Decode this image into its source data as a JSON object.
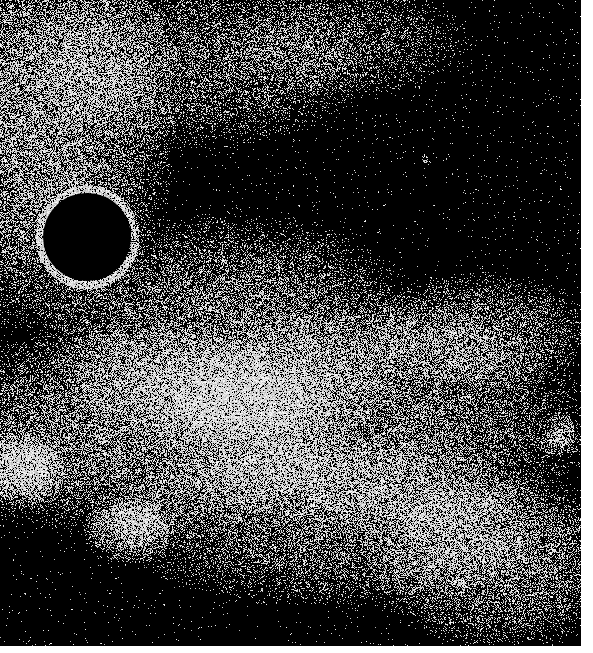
{
  "image": {
    "subject": "starfield-illustration",
    "scene_width": 581,
    "scene_height": 646,
    "background_color": "#000000",
    "star_color": "#ffffff",
    "border_color": "#ffffff"
  },
  "disk": {
    "cx": 87,
    "cy": 237,
    "radius": 44,
    "color": "#000000",
    "halo_color": "#ffffff"
  },
  "clouds": [
    {
      "cx": 40,
      "cy": 120,
      "rx": 140,
      "ry": 220,
      "density": 0.55
    },
    {
      "cx": 200,
      "cy": 60,
      "rx": 180,
      "ry": 90,
      "density": 0.35
    },
    {
      "cx": 230,
      "cy": 330,
      "rx": 200,
      "ry": 120,
      "density": 0.45
    },
    {
      "cx": 130,
      "cy": 430,
      "rx": 220,
      "ry": 110,
      "density": 0.5
    },
    {
      "cx": 380,
      "cy": 420,
      "rx": 220,
      "ry": 120,
      "density": 0.45
    },
    {
      "cx": 480,
      "cy": 330,
      "rx": 120,
      "ry": 60,
      "density": 0.4
    },
    {
      "cx": 330,
      "cy": 520,
      "rx": 230,
      "ry": 90,
      "density": 0.4
    },
    {
      "cx": 500,
      "cy": 560,
      "rx": 140,
      "ry": 90,
      "density": 0.45
    },
    {
      "cx": 130,
      "cy": 530,
      "rx": 50,
      "ry": 35,
      "density": 0.55
    },
    {
      "cx": 20,
      "cy": 470,
      "rx": 50,
      "ry": 40,
      "density": 0.55
    },
    {
      "cx": 350,
      "cy": 40,
      "rx": 120,
      "ry": 60,
      "density": 0.25
    }
  ],
  "background_star_density": 0.012,
  "bright_features": [
    {
      "name": "bright-star",
      "x": 425,
      "y": 160,
      "r": 3
    },
    {
      "name": "bright-cluster",
      "x": 560,
      "y": 435,
      "r": 12
    }
  ]
}
